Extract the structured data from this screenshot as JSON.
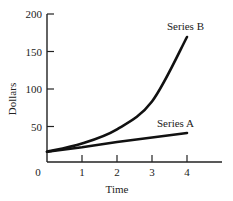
{
  "chart_data": {
    "type": "line",
    "title": "",
    "xlabel": "Time",
    "ylabel": "Dollars",
    "x": [
      0,
      1,
      2,
      3,
      4
    ],
    "x_ticks": [
      "0",
      "1",
      "2",
      "3",
      "4"
    ],
    "y_ticks": [
      "50",
      "100",
      "150",
      "200"
    ],
    "xlim": [
      0,
      5
    ],
    "ylim": [
      0,
      200
    ],
    "grid": false,
    "legend": "inline labels at line ends",
    "series": [
      {
        "name": "Series A",
        "values": [
          15,
          21,
          28,
          34,
          40
        ],
        "shape": "linear"
      },
      {
        "name": "Series B",
        "values": [
          15,
          26,
          45,
          82,
          168
        ],
        "shape": "exponential"
      }
    ],
    "colors": {
      "line": "#111111",
      "axis": "#222222"
    }
  }
}
